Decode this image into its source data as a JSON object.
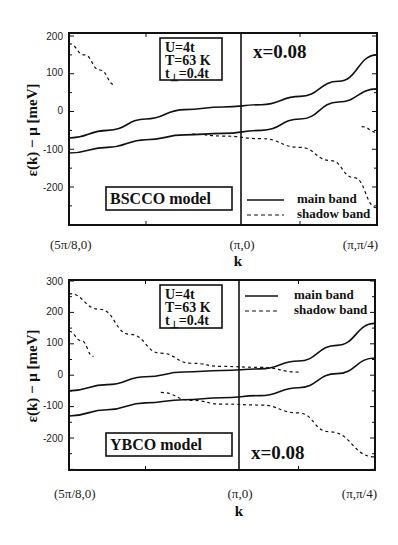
{
  "chart_data": [
    {
      "type": "line",
      "title": "BSCCO model",
      "panel": "top",
      "xlabel": "k",
      "ylabel": "ε(k) − μ [meV]",
      "x_tick_labels": [
        "(5π/8,0)",
        "(π,0)",
        "(π,π/4)"
      ],
      "x": [
        0,
        0.25,
        0.5,
        0.75,
        1.0,
        1.25,
        1.5,
        1.75,
        2.0
      ],
      "yticks": [
        200,
        100,
        0,
        -100,
        -200
      ],
      "ylim": [
        -290,
        210
      ],
      "grid": false,
      "annotations": {
        "params": [
          "U=4t",
          "T=63 K",
          "t⊥=0.4t"
        ],
        "doping": "x=0.08"
      },
      "legend": {
        "position": "lower right",
        "entries": [
          "main band",
          "shadow band"
        ]
      },
      "series": [
        {
          "name": "main band (upper)",
          "style": "solid",
          "x": [
            0,
            0.25,
            0.5,
            0.75,
            1.0,
            1.25,
            1.5,
            1.75,
            2.0
          ],
          "values": [
            -70,
            -50,
            -20,
            5,
            12,
            18,
            40,
            80,
            150
          ]
        },
        {
          "name": "main band (lower)",
          "style": "solid",
          "x": [
            0,
            0.25,
            0.5,
            0.75,
            1.0,
            1.25,
            1.5,
            1.75,
            2.0
          ],
          "values": [
            -110,
            -95,
            -75,
            -62,
            -58,
            -50,
            -20,
            25,
            60
          ]
        },
        {
          "name": "shadow band (left)",
          "style": "dashed",
          "x": [
            0,
            0.1,
            0.2,
            0.3
          ],
          "values": [
            180,
            150,
            110,
            70
          ]
        },
        {
          "name": "shadow band (center)",
          "style": "dashed",
          "x": [
            0.8,
            1.0,
            1.25,
            1.5,
            1.7,
            1.85,
            2.0
          ],
          "values": [
            -60,
            -65,
            -72,
            -95,
            -130,
            -175,
            -255
          ]
        },
        {
          "name": "shadow band (right)",
          "style": "dashed",
          "x": [
            1.9,
            2.0
          ],
          "values": [
            -40,
            -55
          ]
        }
      ]
    },
    {
      "type": "line",
      "title": "YBCO model",
      "panel": "bottom",
      "xlabel": "k",
      "ylabel": "ε(k) − μ [meV]",
      "x_tick_labels": [
        "(5π/8,0)",
        "(π,0)",
        "(π,π/4)"
      ],
      "x": [
        0,
        0.25,
        0.5,
        0.75,
        1.0,
        1.25,
        1.5,
        1.75,
        2.0
      ],
      "yticks": [
        300,
        200,
        100,
        0,
        -100,
        -200
      ],
      "ylim": [
        -300,
        305
      ],
      "grid": false,
      "annotations": {
        "params": [
          "U=4t",
          "T=63 K",
          "t⊥=0.4t"
        ],
        "doping": "x=0.08"
      },
      "legend": {
        "position": "upper right",
        "entries": [
          "main band",
          "shadow band"
        ]
      },
      "series": [
        {
          "name": "main band (upper)",
          "style": "solid",
          "x": [
            0,
            0.25,
            0.5,
            0.75,
            1.0,
            1.25,
            1.5,
            1.75,
            2.0
          ],
          "values": [
            -50,
            -30,
            -5,
            10,
            15,
            20,
            45,
            95,
            165
          ]
        },
        {
          "name": "main band (lower)",
          "style": "solid",
          "x": [
            0,
            0.25,
            0.5,
            0.75,
            1.0,
            1.25,
            1.5,
            1.75,
            2.0
          ],
          "values": [
            -130,
            -110,
            -88,
            -78,
            -72,
            -65,
            -40,
            5,
            55
          ]
        },
        {
          "name": "shadow band (upper)",
          "style": "dashed",
          "x": [
            0,
            0.2,
            0.4,
            0.6,
            0.8,
            1.0,
            1.25,
            1.5
          ],
          "values": [
            260,
            210,
            130,
            70,
            38,
            28,
            25,
            10
          ]
        },
        {
          "name": "shadow band (left short)",
          "style": "dashed",
          "x": [
            0,
            0.08,
            0.16
          ],
          "values": [
            140,
            110,
            60
          ]
        },
        {
          "name": "shadow band (lower)",
          "style": "dashed",
          "x": [
            0.6,
            0.8,
            1.0,
            1.25,
            1.5,
            1.7,
            2.0
          ],
          "values": [
            -55,
            -80,
            -92,
            -95,
            -120,
            -180,
            -260
          ]
        }
      ]
    }
  ],
  "panels": {
    "top": {
      "params": [
        "U=4t",
        "T=63 K",
        "t",
        "⊥",
        "=0.4t"
      ],
      "doping": "x=0.08",
      "model": "BSCCO model",
      "legend_main": "main band",
      "legend_shadow": "shadow band",
      "yticks": [
        "200",
        "100",
        "0",
        "-100",
        "-200"
      ],
      "xticks": [
        "(5π/8,0)",
        "(π,0)",
        "(π,π/4)"
      ],
      "xlabel": "k",
      "ylabel": "ε(k) − μ [meV]"
    },
    "bottom": {
      "params": [
        "U=4t",
        "T=63 K",
        "t",
        "⊥",
        "=0.4t"
      ],
      "doping": "x=0.08",
      "model": "YBCO model",
      "legend_main": "main band",
      "legend_shadow": "shadow band",
      "yticks": [
        "300",
        "200",
        "100",
        "0",
        "-100",
        "-200"
      ],
      "xticks": [
        "(5π/8,0)",
        "(π,0)",
        "(π,π/4)"
      ],
      "xlabel": "k",
      "ylabel": "ε(k) − μ [meV]"
    }
  }
}
